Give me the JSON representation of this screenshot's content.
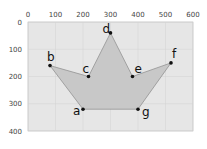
{
  "chart_data": {
    "type": "scatter",
    "title": "",
    "xlabel": "",
    "ylabel": "",
    "xlim": [
      0,
      600
    ],
    "ylim": [
      400,
      0
    ],
    "y_inverted": true,
    "grid": true,
    "x_ticks": [
      "0",
      "100",
      "200",
      "300",
      "400",
      "500",
      "600"
    ],
    "y_ticks": [
      "0",
      "100",
      "200",
      "300",
      "400"
    ],
    "points": [
      {
        "label": "a",
        "x": 200,
        "y": 320
      },
      {
        "label": "b",
        "x": 80,
        "y": 160
      },
      {
        "label": "c",
        "x": 220,
        "y": 200
      },
      {
        "label": "d",
        "x": 300,
        "y": 40
      },
      {
        "label": "e",
        "x": 380,
        "y": 200
      },
      {
        "label": "f",
        "x": 520,
        "y": 150
      },
      {
        "label": "g",
        "x": 400,
        "y": 320
      }
    ],
    "polygon_order": [
      "a",
      "b",
      "c",
      "d",
      "e",
      "f",
      "g"
    ],
    "colors": {
      "plot_background": "#e6e6e6",
      "polygon_fill": "#c8c8c8",
      "polygon_stroke": "#8a8a8a",
      "grid": "#d2d2d2",
      "point": "#111111"
    }
  }
}
